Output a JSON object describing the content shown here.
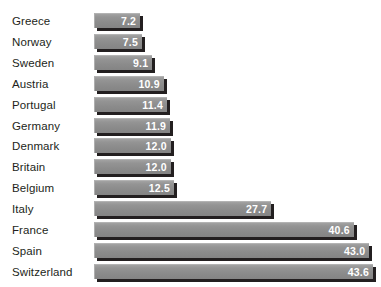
{
  "chart_data": {
    "type": "bar",
    "orientation": "horizontal",
    "title": "",
    "subtitle": "",
    "xlabel": "",
    "ylabel": "",
    "grid": false,
    "legend": null,
    "axis_visible": false,
    "tick_labels": [],
    "value_labels_shown": true,
    "xlim": [
      0,
      45
    ],
    "categories": [
      "Greece",
      "Norway",
      "Sweden",
      "Austria",
      "Portugal",
      "Germany",
      "Denmark",
      "Britain",
      "Belgium",
      "Italy",
      "France",
      "Spain",
      "Switzerland"
    ],
    "values": [
      7.2,
      7.5,
      9.1,
      10.9,
      11.4,
      11.9,
      12.0,
      12.0,
      12.5,
      27.7,
      40.6,
      43.0,
      43.6
    ],
    "value_text": [
      "7.2",
      "7.5",
      "9.1",
      "10.9",
      "11.4",
      "11.9",
      "12.0",
      "12.0",
      "12.5",
      "27.7",
      "40.6",
      "43.0",
      "43.6"
    ],
    "colors": {
      "bar_fill": "#8e8e8e",
      "bar_highlight": "#a2a2a2",
      "bar_shadow": "#231f20",
      "value_text": "#ffffff",
      "label_text": "#231f20",
      "background": "#ffffff"
    }
  }
}
